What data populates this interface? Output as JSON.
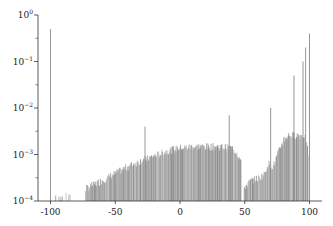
{
  "chart_data": {
    "type": "bar",
    "title": "",
    "xlabel": "",
    "ylabel": "",
    "yscale": "log",
    "xlim": [
      -105,
      105
    ],
    "ylim": [
      0.0001,
      1
    ],
    "grid": false,
    "legend": null,
    "x_ticks": [
      -100,
      -50,
      0,
      50,
      100
    ],
    "x_tick_labels": [
      "-100",
      "-50",
      "0",
      "50",
      "100"
    ],
    "y_ticks": [
      1,
      0.1,
      0.01,
      0.001,
      0.0001
    ],
    "y_tick_labels": [
      {
        "base": "10",
        "exp": "0"
      },
      {
        "base": "10",
        "exp": "−1"
      },
      {
        "base": "10",
        "exp": "−2"
      },
      {
        "base": "10",
        "exp": "−3"
      },
      {
        "base": "10",
        "exp": "−4"
      }
    ],
    "bar_color": "#8c8c8c",
    "spikes": [
      {
        "x": -100,
        "y": 0.5
      },
      {
        "x": -27,
        "y": 0.004
      },
      {
        "x": 38,
        "y": 0.007
      },
      {
        "x": 70,
        "y": 0.01
      },
      {
        "x": 88,
        "y": 0.05
      },
      {
        "x": 95,
        "y": 0.1
      },
      {
        "x": 100,
        "y": 0.4
      },
      {
        "x": 97,
        "y": 0.2
      }
    ],
    "envelope": [
      {
        "x": -98,
        "y": 0.00012
      },
      {
        "x": -90,
        "y": 0.00014
      },
      {
        "x": -80,
        "y": 0.00012
      },
      {
        "x": -75,
        "y": 0.00018
      },
      {
        "x": -70,
        "y": 0.00022
      },
      {
        "x": -60,
        "y": 0.0003
      },
      {
        "x": -50,
        "y": 0.00042
      },
      {
        "x": -40,
        "y": 0.0006
      },
      {
        "x": -30,
        "y": 0.0008
      },
      {
        "x": -20,
        "y": 0.001
      },
      {
        "x": -10,
        "y": 0.0013
      },
      {
        "x": 0,
        "y": 0.0015
      },
      {
        "x": 10,
        "y": 0.0016
      },
      {
        "x": 20,
        "y": 0.0016
      },
      {
        "x": 30,
        "y": 0.0016
      },
      {
        "x": 40,
        "y": 0.0015
      },
      {
        "x": 44,
        "y": 0.0012
      },
      {
        "x": 47,
        "y": 0.0008
      },
      {
        "x": 48,
        "y": 0.0001
      },
      {
        "x": 50,
        "y": 0.00022
      },
      {
        "x": 55,
        "y": 0.0003
      },
      {
        "x": 60,
        "y": 0.00033
      },
      {
        "x": 65,
        "y": 0.0004
      },
      {
        "x": 68,
        "y": 0.0007
      },
      {
        "x": 72,
        "y": 0.0006
      },
      {
        "x": 76,
        "y": 0.0012
      },
      {
        "x": 80,
        "y": 0.0023
      },
      {
        "x": 84,
        "y": 0.0028
      },
      {
        "x": 90,
        "y": 0.0028
      },
      {
        "x": 96,
        "y": 0.0028
      },
      {
        "x": 99,
        "y": 0.0012
      }
    ]
  }
}
